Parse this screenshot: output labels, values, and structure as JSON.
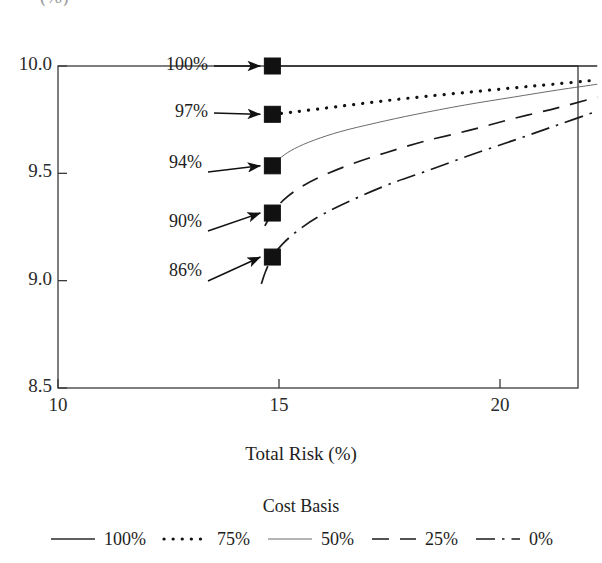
{
  "chart_data": {
    "type": "line",
    "title": "",
    "xlabel": "Total Risk (%)",
    "ylabel": "(%)",
    "ylabel_cropped": true,
    "xlim": [
      10,
      22.2
    ],
    "ylim": [
      8.5,
      10.0
    ],
    "xticks": [
      "10",
      "15",
      "20"
    ],
    "xtick_values": [
      10,
      15,
      20
    ],
    "yticks": [
      "10.0",
      "9.5",
      "9.0",
      "8.5"
    ],
    "ytick_values": [
      10.0,
      9.5,
      9.0,
      8.5
    ],
    "grid": false,
    "frame": "box",
    "legend_title": "Cost Basis",
    "legend_position": "bottom",
    "line_color": "#1a1a1a",
    "marker_color": "#111111",
    "marker_shape": "square",
    "series": [
      {
        "name": "100%",
        "legend_label": "100%",
        "dash": "solid",
        "width": 1.4,
        "marker_label": "100%",
        "marker_point": [
          14.85,
          10.0
        ],
        "points": [
          [
            14.85,
            10.0
          ],
          [
            15.5,
            10.0
          ],
          [
            16.5,
            10.0
          ],
          [
            17.5,
            10.0
          ],
          [
            18.5,
            10.0
          ],
          [
            19.5,
            10.0
          ],
          [
            20.5,
            10.0
          ],
          [
            21.4,
            10.0
          ],
          [
            22.2,
            10.0
          ]
        ]
      },
      {
        "name": "75%",
        "legend_label": "75%",
        "dash": "dotted",
        "width": 2.6,
        "marker_label": "97%",
        "marker_point": [
          14.85,
          9.775
        ],
        "points": [
          [
            14.85,
            9.775
          ],
          [
            15.3,
            9.785
          ],
          [
            15.9,
            9.8
          ],
          [
            16.6,
            9.818
          ],
          [
            17.4,
            9.838
          ],
          [
            18.3,
            9.858
          ],
          [
            19.3,
            9.878
          ],
          [
            20.3,
            9.898
          ],
          [
            21.2,
            9.915
          ],
          [
            22.2,
            9.935
          ]
        ]
      },
      {
        "name": "50%",
        "legend_label": "50%",
        "dash": "thin-solid",
        "width": 0.8,
        "marker_label": "94%",
        "marker_point": [
          14.85,
          9.535
        ],
        "points": [
          [
            14.7,
            9.5
          ],
          [
            14.85,
            9.535
          ],
          [
            15.05,
            9.575
          ],
          [
            15.35,
            9.615
          ],
          [
            15.8,
            9.655
          ],
          [
            16.4,
            9.695
          ],
          [
            17.2,
            9.735
          ],
          [
            18.1,
            9.775
          ],
          [
            19.2,
            9.818
          ],
          [
            20.3,
            9.855
          ],
          [
            21.3,
            9.888
          ],
          [
            22.2,
            9.915
          ]
        ]
      },
      {
        "name": "25%",
        "legend_label": "25%",
        "dash": "dashed",
        "width": 1.6,
        "marker_label": "90%",
        "marker_point": [
          14.85,
          9.315
        ],
        "points": [
          [
            14.68,
            9.255
          ],
          [
            14.85,
            9.315
          ],
          [
            15.1,
            9.375
          ],
          [
            15.45,
            9.43
          ],
          [
            15.95,
            9.485
          ],
          [
            16.6,
            9.54
          ],
          [
            17.4,
            9.595
          ],
          [
            18.3,
            9.65
          ],
          [
            19.3,
            9.7
          ],
          [
            20.3,
            9.755
          ],
          [
            21.3,
            9.805
          ],
          [
            22.2,
            9.855
          ]
        ]
      },
      {
        "name": "0%",
        "legend_label": "0%",
        "dash": "dash-dot",
        "width": 1.6,
        "marker_label": "86%",
        "marker_point": [
          14.85,
          9.11
        ],
        "points": [
          [
            14.6,
            8.985
          ],
          [
            14.7,
            9.045
          ],
          [
            14.85,
            9.11
          ],
          [
            15.1,
            9.175
          ],
          [
            15.5,
            9.245
          ],
          [
            16.0,
            9.31
          ],
          [
            16.7,
            9.38
          ],
          [
            17.5,
            9.45
          ],
          [
            18.4,
            9.515
          ],
          [
            19.4,
            9.59
          ],
          [
            20.4,
            9.66
          ],
          [
            21.3,
            9.725
          ],
          [
            22.2,
            9.79
          ]
        ]
      }
    ],
    "annotations": [
      {
        "label": "100%",
        "target": [
          14.85,
          10.0
        ]
      },
      {
        "label": "97%",
        "target": [
          14.85,
          9.775
        ]
      },
      {
        "label": "94%",
        "target": [
          14.85,
          9.535
        ]
      },
      {
        "label": "90%",
        "target": [
          14.85,
          9.315
        ]
      },
      {
        "label": "86%",
        "target": [
          14.85,
          9.11
        ]
      }
    ]
  },
  "legend": {
    "title": "Cost Basis",
    "entries": [
      {
        "label": "100%",
        "dash": "solid"
      },
      {
        "label": "75%",
        "dash": "dotted"
      },
      {
        "label": "50%",
        "dash": "thin-solid"
      },
      {
        "label": "25%",
        "dash": "dashed"
      },
      {
        "label": "0%",
        "dash": "dash-dot"
      }
    ]
  },
  "axes": {
    "x_title": "Total Risk (%)",
    "y_title_fragment": "(%)",
    "x_tick_labels": [
      "10",
      "15",
      "20"
    ],
    "y_tick_labels": [
      "10.0",
      "9.5",
      "9.0",
      "8.5"
    ]
  }
}
